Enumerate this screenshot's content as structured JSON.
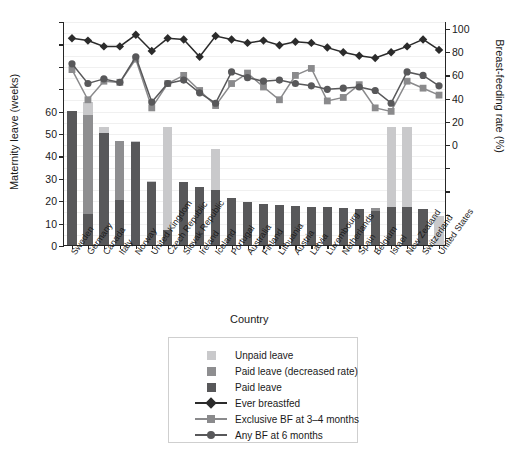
{
  "chart_data": {
    "type": "bar",
    "title": "",
    "xlabel": "Country",
    "ylabel": "Maternity leave (weeks)",
    "ylabel_right": "Breast-feeding rate (%)",
    "ylim": [
      0,
      100
    ],
    "yticks": [
      0,
      10,
      20,
      30,
      40,
      50,
      60
    ],
    "ylim_right": [
      0,
      100
    ],
    "yticks_right": [
      0,
      20,
      40,
      60,
      80,
      100
    ],
    "grid": true,
    "legend_position": "below-plot",
    "categories": [
      "Sweden",
      "Germany",
      "Canada",
      "Italy",
      "Norway",
      "United Kingdom",
      "Czech Republic",
      "Slovak Republic",
      "Ireland",
      "Iceland",
      "Portugal",
      "Australia",
      "Finland",
      "Lithuania",
      "Austria",
      "Latvia",
      "Luxembourg",
      "Netherlands",
      "Spain",
      "Belgium",
      "Israel",
      "New Zealand",
      "Switzerland",
      "United States"
    ],
    "series": [
      {
        "name": "Paid leave",
        "type": "bar-segment",
        "color": "#58585a",
        "values": [
          60,
          14,
          50,
          20,
          46,
          28,
          6.5,
          28,
          26,
          24.5,
          21,
          19,
          18.5,
          18,
          17.5,
          17,
          17,
          16.5,
          16,
          15,
          17,
          17,
          16,
          0
        ]
      },
      {
        "name": "Paid leave (decreased rate)",
        "type": "bar-segment",
        "color": "#8e8e90",
        "values": [
          0,
          44,
          0,
          26.5,
          0,
          0,
          0,
          0,
          0,
          0,
          0,
          0,
          0,
          0,
          0,
          0,
          0,
          0,
          0,
          1.5,
          0,
          0,
          0,
          0
        ]
      },
      {
        "name": "Unpaid leave",
        "type": "bar-segment",
        "color": "#c9c9cb",
        "values": [
          0,
          6,
          2.5,
          0,
          0.5,
          0.5,
          46,
          0,
          0,
          18.5,
          0,
          0,
          0,
          0,
          0,
          0,
          0,
          0,
          0,
          0,
          35.5,
          35.5,
          0,
          13
        ]
      },
      {
        "name": "Ever breastfed",
        "type": "line",
        "color": "#2b2b2b",
        "marker": "diamond",
        "axis": "right",
        "values": [
          92,
          90,
          85,
          85,
          95,
          81,
          92,
          91,
          76,
          94,
          91,
          88,
          90,
          86,
          89,
          88,
          84,
          80,
          77,
          75,
          80,
          85,
          91,
          82
        ]
      },
      {
        "name": "Exclusive BF at 3-4 months",
        "type": "line",
        "color": "#8a8a8c",
        "marker": "square",
        "axis": "right",
        "values": [
          65,
          39,
          55,
          54,
          74,
          32,
          53,
          60,
          47,
          34,
          53,
          62,
          50,
          39,
          60,
          66,
          38,
          41,
          52,
          32,
          29,
          55,
          49,
          43
        ]
      },
      {
        "name": "Any BF at 6 months",
        "type": "line",
        "color": "#58585a",
        "marker": "circle",
        "axis": "right",
        "values": [
          70,
          53,
          57,
          54,
          76,
          37,
          53,
          56,
          45,
          36,
          63,
          58,
          55,
          56,
          53,
          51,
          48,
          49,
          50,
          47,
          36,
          63,
          60,
          51
        ]
      }
    ]
  },
  "legend": {
    "items": [
      {
        "label": "Unpaid leave",
        "kind": "swatch",
        "color": "#c9c9cb",
        "name": "legend-unpaid-leave"
      },
      {
        "label": "Paid leave (decreased rate)",
        "kind": "swatch",
        "color": "#8e8e90",
        "name": "legend-paid-leave-decreased"
      },
      {
        "label": "Paid leave",
        "kind": "swatch",
        "color": "#58585a",
        "name": "legend-paid-leave"
      },
      {
        "label": "Ever breastfed",
        "kind": "line-diamond",
        "color": "#2b2b2b",
        "name": "legend-ever-breastfed"
      },
      {
        "label": "Exclusive BF at 3–4 months",
        "kind": "line-square",
        "color": "#8a8a8c",
        "name": "legend-exclusive-bf"
      },
      {
        "label": "Any BF at 6 months",
        "kind": "line-circle",
        "color": "#58585a",
        "name": "legend-any-bf-6m"
      }
    ]
  }
}
